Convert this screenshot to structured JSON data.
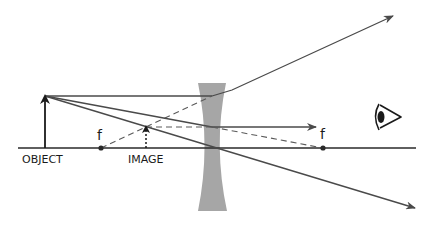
{
  "diagram": {
    "labels": {
      "object": "OBJECT",
      "image": "IMAGE",
      "focal_left": "f",
      "focal_right": "f"
    },
    "colors": {
      "lens": "#a6a6a6",
      "ray": "#4a4a4a",
      "axis": "#2a2a2a"
    },
    "elements": [
      "optical-axis",
      "object-arrow",
      "image-arrow (dashed, virtual)",
      "concave-lens",
      "focal-point-left",
      "focal-point-right",
      "eye-icon",
      "ray-parallel (refracts upward, dashed extension back to left focal point)",
      "ray-to-right-focus (exits parallel, dashed extension back)",
      "ray-through-center (undeviated)"
    ]
  }
}
